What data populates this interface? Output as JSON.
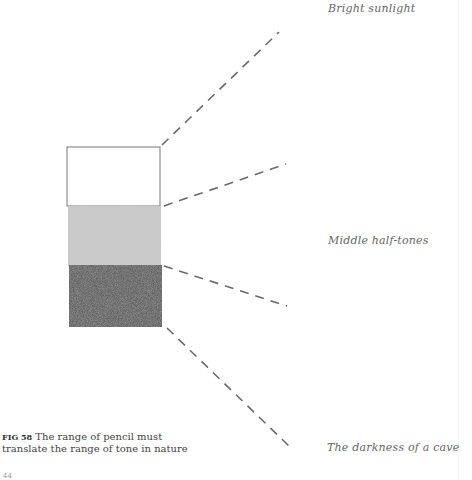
{
  "figure": {
    "number_label": "FIG 58",
    "caption": "The range of pencil must translate the range of tone in nature",
    "caption_line1": "The range of pencil must",
    "caption_line2": "translate the range of tone in nature"
  },
  "tone_labels": {
    "light": "Bright sunlight",
    "mid": "Middle half-tones",
    "dark": "The darkness of a cave"
  },
  "tone_scale": {
    "swatches": [
      {
        "name": "white",
        "color": "#ffffff"
      },
      {
        "name": "mid-grey",
        "color": "#c8c8c8"
      },
      {
        "name": "dark-grey",
        "color": "#5e5e5e"
      }
    ],
    "line_color": "#6a6a6a"
  },
  "page_number": "44"
}
